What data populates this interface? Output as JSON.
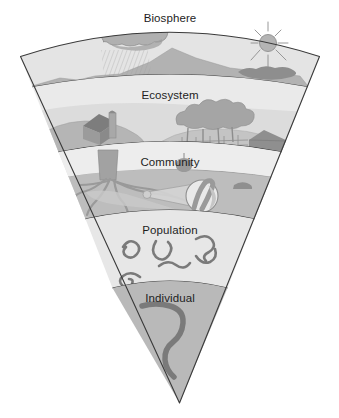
{
  "figure": {
    "shape": "inverted-cone-wedge",
    "background_color": "#ffffff",
    "outline_color": "#3a3a3a"
  },
  "levels": [
    {
      "id": "biosphere",
      "label": "Biosphere",
      "order": 1,
      "band_fill": "#e3e3e3",
      "scenery": [
        "rain-cloud",
        "rain-hatching",
        "mountain-range",
        "sun",
        "sun-rays",
        "dark-cloud-bank"
      ]
    },
    {
      "id": "ecosystem",
      "label": "Ecosystem",
      "order": 2,
      "band_fill": "#e8e8e8",
      "scenery": [
        "barn",
        "silo",
        "rolling-hills",
        "tree-cluster",
        "fence",
        "roof",
        "field"
      ]
    },
    {
      "id": "community",
      "label": "Community",
      "order": 3,
      "band_fill": "#e0e0e0",
      "scenery": [
        "tree-trunk",
        "tree-roots",
        "apple-shrub",
        "soil-layer",
        "magnifier-lens",
        "worm-closeup",
        "small-animal"
      ]
    },
    {
      "id": "population",
      "label": "Population",
      "order": 4,
      "band_fill": "#e6e6e6",
      "scenery": [
        "worm",
        "worm",
        "worm",
        "worm",
        "worm",
        "worm"
      ]
    },
    {
      "id": "individual",
      "label": "Individual",
      "order": 5,
      "band_fill": "#b8b8b8",
      "scenery": [
        "worm"
      ]
    }
  ],
  "palette": {
    "light_gray": "#e6e6e6",
    "mid_gray": "#b8b8b8",
    "dark_gray": "#8f8f8f",
    "darker_gray": "#6f6f6f",
    "line": "#3a3a3a",
    "text": "#1d1d1d"
  }
}
